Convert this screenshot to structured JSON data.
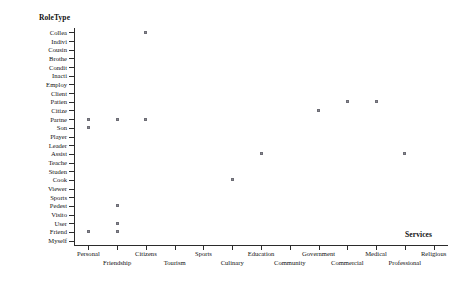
{
  "chart_data": {
    "type": "scatter",
    "title": "",
    "ylabel": "RoleType",
    "xlabel": "Services",
    "grid": false,
    "legend": false,
    "categories": [
      "Personal",
      "Friendship",
      "Citizens",
      "Tourism",
      "Sports",
      "Culinary",
      "Education",
      "Community",
      "Government",
      "Commercial",
      "Medical",
      "Professional",
      "Religious"
    ],
    "y_categories": [
      "Collea",
      "Indivi",
      "Cousin",
      "Brothe",
      "Condit",
      "Inacti",
      "Employ",
      "Client",
      "Patien",
      "Citize",
      "Partne",
      "Son",
      "Player",
      "Leader",
      "Assist",
      "Teache",
      "Studen",
      "Cook",
      "Viewer",
      "Sports",
      "Pedest",
      "Visito",
      "User",
      "Friend",
      "Myself"
    ],
    "points": [
      {
        "x": "Citizens",
        "y": "Collea"
      },
      {
        "x": "Commercial",
        "y": "Patien"
      },
      {
        "x": "Medical",
        "y": "Patien"
      },
      {
        "x": "Government",
        "y": "Citize"
      },
      {
        "x": "Personal",
        "y": "Partne"
      },
      {
        "x": "Friendship",
        "y": "Partne"
      },
      {
        "x": "Citizens",
        "y": "Partne"
      },
      {
        "x": "Personal",
        "y": "Son"
      },
      {
        "x": "Education",
        "y": "Assist"
      },
      {
        "x": "Professional",
        "y": "Assist"
      },
      {
        "x": "Culinary",
        "y": "Cook"
      },
      {
        "x": "Friendship",
        "y": "Pedest"
      },
      {
        "x": "Friendship",
        "y": "User"
      },
      {
        "x": "Personal",
        "y": "Friend"
      },
      {
        "x": "Friendship",
        "y": "Friend"
      }
    ]
  },
  "axes": {
    "y_title": "RoleType",
    "x_title": "Services"
  }
}
